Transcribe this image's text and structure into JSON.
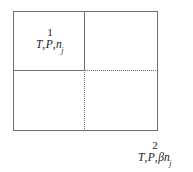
{
  "diagram": {
    "type": "partitioned-rectangle",
    "colors": {
      "line": "#6f6f6f",
      "text": "#1a1a1a",
      "background": "#ffffff"
    },
    "outer_box": {
      "name": "system-boundary",
      "stroke": "solid"
    },
    "partitions": [
      {
        "name": "vertical-solid-divider",
        "orientation": "vertical",
        "stroke": "solid"
      },
      {
        "name": "horizontal-solid-divider",
        "orientation": "horizontal",
        "stroke": "solid"
      },
      {
        "name": "horizontal-dotted-divider",
        "orientation": "horizontal",
        "stroke": "dotted"
      },
      {
        "name": "vertical-dotted-divider",
        "orientation": "vertical",
        "stroke": "dotted"
      }
    ],
    "labels": {
      "region1": {
        "number": "1",
        "variables": {
          "t": "T",
          "sep1": ",",
          "p": "P",
          "sep2": ",",
          "n": "n",
          "n_sub": "j"
        },
        "plain": "T, P, n_j"
      },
      "region2": {
        "number": "2",
        "variables": {
          "t": "T",
          "sep1": ",",
          "p": "P",
          "sep2": ",",
          "beta": "β",
          "n": "n",
          "n_sub": "j"
        },
        "plain": "T, P, βn_j"
      }
    }
  }
}
